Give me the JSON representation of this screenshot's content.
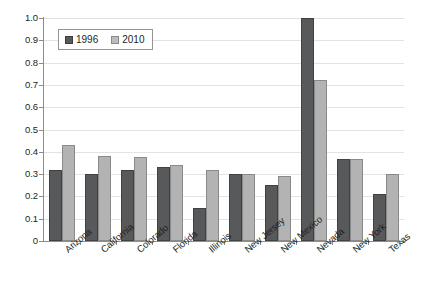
{
  "chart_data": {
    "type": "bar",
    "title": "",
    "subtitle": "",
    "xlabel": "",
    "ylabel": "",
    "ylim": [
      0,
      1.0
    ],
    "ytick_step": 0.1,
    "grid": true,
    "legend_position": "top-left-inside",
    "categories": [
      "Arizona",
      "California",
      "Colorado",
      "Florida",
      "Illinois",
      "New Jersey",
      "New Mexico",
      "Nevada",
      "New York",
      "Texas"
    ],
    "ytick_labels": [
      "0",
      "0.1",
      "0.2",
      "0.3",
      "0.4",
      "0.5",
      "0.6",
      "0.7",
      "0.8",
      "0.9",
      "1.0"
    ],
    "ytick_values": [
      0,
      0.1,
      0.2,
      0.3,
      0.4,
      0.5,
      0.6,
      0.7,
      0.8,
      0.9,
      1.0
    ],
    "series": [
      {
        "name": "1996",
        "color": "#58595b",
        "values": [
          0.32,
          0.3,
          0.32,
          0.33,
          0.15,
          0.3,
          0.25,
          1.0,
          0.37,
          0.21
        ]
      },
      {
        "name": "2010",
        "color": "#b3b3b3",
        "values": [
          0.43,
          0.38,
          0.375,
          0.34,
          0.32,
          0.3,
          0.29,
          0.72,
          0.37,
          0.3
        ]
      }
    ]
  },
  "legend": {
    "items": [
      {
        "label": "1996"
      },
      {
        "label": "2010"
      }
    ]
  },
  "colors": {
    "series_1996": "#58595b",
    "series_2010": "#b3b3b3",
    "axis": "#8c8c8c",
    "grid": "#e3e3e3",
    "background": "#ffffff",
    "text": "#231f20"
  }
}
